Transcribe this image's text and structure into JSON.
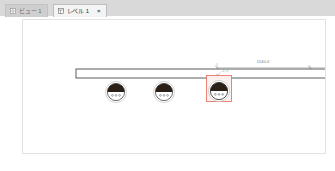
{
  "tabs": [
    {
      "label": "ビュー 1",
      "icon": "view-window-icon",
      "active": false,
      "closable": false
    },
    {
      "label": "レベル 1",
      "icon": "floor-plan-icon",
      "active": true,
      "closable": true,
      "close_label": "×"
    }
  ],
  "canvas": {
    "dimension": {
      "value": "1140.0",
      "unit_implied": "mm"
    },
    "element_tag": {
      "label": "コン"
    },
    "wall": {
      "name": "wall-element"
    },
    "outlets": [
      {
        "name": "duplex-receptacle-1",
        "selected": false
      },
      {
        "name": "duplex-receptacle-2",
        "selected": false
      },
      {
        "name": "duplex-receptacle-3",
        "selected": true
      }
    ],
    "colors": {
      "selection": "#e8776b",
      "selection_fill": "#fdf1ef",
      "line": "#4a4a4a",
      "dimension": "#8a8a8a",
      "outlet_fill": "#2b2018",
      "canvas_bg": "#ffffff"
    }
  }
}
